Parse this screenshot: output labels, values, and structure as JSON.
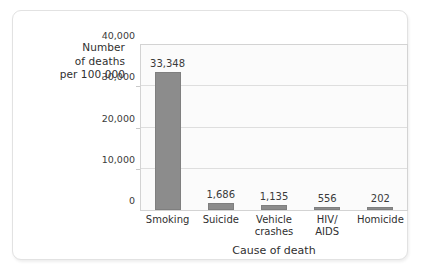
{
  "chart_data": {
    "type": "bar",
    "title": "",
    "categories": [
      "Smoking",
      "Suicide",
      "Vehicle crashes",
      "HIV/ AIDS",
      "Homicide"
    ],
    "category_lines": [
      [
        "Smoking"
      ],
      [
        "Suicide"
      ],
      [
        "Vehicle",
        "crashes"
      ],
      [
        "HIV/",
        "AIDS"
      ],
      [
        "Homicide"
      ]
    ],
    "values": [
      33348,
      1686,
      1135,
      556,
      202
    ],
    "value_labels": [
      "33,348",
      "1,686",
      "1,135",
      "556",
      "202"
    ],
    "xlabel": "Cause of death",
    "ylabel": "Number of deaths per 100,000",
    "ylabel_lines": [
      "Number",
      "of deaths",
      "per 100,000"
    ],
    "ylim": [
      0,
      40000
    ],
    "ytick_values": [
      0,
      10000,
      20000,
      30000,
      40000
    ],
    "ytick_labels": [
      "0",
      "10,000",
      "20,000",
      "30,000",
      "40,000"
    ],
    "grid": true,
    "legend": false,
    "bar_color": "#8c8c8c",
    "plot_background": "#fbfbfb",
    "gridline_color": "#dedede"
  }
}
